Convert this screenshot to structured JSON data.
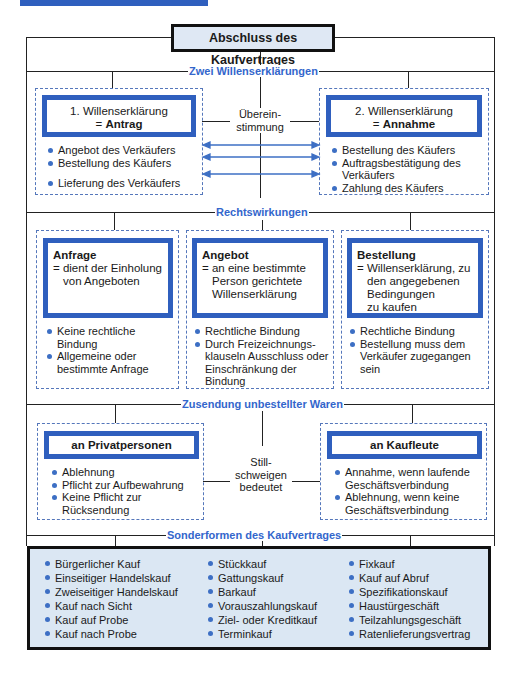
{
  "title": "Abschluss des Kaufvertrages",
  "sections": {
    "s1": "Zwei Willenserklärungen",
    "s2": "Rechtswirkungen",
    "s3": "Zusendung unbestellter Waren",
    "s4": "Sonderformen des Kaufvertrages"
  },
  "willen": {
    "left": {
      "line1": "1. Willenserklärung",
      "eq": "= ",
      "bold": "Antrag",
      "items": [
        "Angebot des Verkäufers",
        "Bestellung des Käufers",
        "Lieferung des Verkäufers"
      ]
    },
    "right": {
      "line1": "2. Willenserklärung",
      "eq": "= ",
      "bold": "Annahme",
      "items": [
        "Bestellung des Käufers",
        "Auftragsbestätigung des Verkäufers",
        "Zahlung des Käufers"
      ]
    },
    "middle": [
      "Überein-",
      "stimmung"
    ]
  },
  "rechts": [
    {
      "title": "Anfrage",
      "desc": [
        "= dient der Einholung",
        "von Angeboten"
      ],
      "items": [
        "Keine rechtliche Bindung",
        "Allgemeine oder bestimmte Anfrage"
      ]
    },
    {
      "title": "Angebot",
      "desc": [
        "= an eine bestimmte",
        "Person gerichtete",
        "Willenserklärung"
      ],
      "items": [
        "Rechtliche Bindung",
        "Durch Freizeichnungs-klauseln Ausschluss oder Einschränkung der Bindung"
      ]
    },
    {
      "title": "Bestellung",
      "desc": [
        "= Willenserklärung, zu",
        "den angegebenen",
        "Bedingungen",
        "zu kaufen"
      ],
      "items": [
        "Rechtliche Bindung",
        "Bestellung muss dem Verkäufer zugegangen sein"
      ]
    }
  ],
  "zusendung": {
    "left": {
      "title": "an Privatpersonen",
      "items": [
        "Ablehnung",
        "Pflicht zur Aufbewahrung",
        "Keine Pflicht zur Rücksendung"
      ]
    },
    "right": {
      "title": "an Kaufleute",
      "items": [
        "Annahme, wenn laufende Geschäftsverbindung",
        "Ablehnung, wenn keine Geschäftsverbindung"
      ]
    },
    "middle": [
      "Still-",
      "schweigen",
      "bedeutet"
    ]
  },
  "sonderformen": [
    [
      "Bürgerlicher Kauf",
      "Einseitiger Handelskauf",
      "Zweiseitiger Handelskauf",
      "Kauf nach Sicht",
      "Kauf auf Probe",
      "Kauf nach Probe"
    ],
    [
      "Stückkauf",
      "Gattungskauf",
      "Barkauf",
      "Vorauszahlungskauf",
      "Ziel- oder Kreditkauf",
      "Terminkauf"
    ],
    [
      "Fixkauf",
      "Kauf auf Abruf",
      "Spezifikationskauf",
      "Haustürgeschäft",
      "Teilzahlungsgeschäft",
      "Ratenlieferungsvertrag"
    ]
  ],
  "colors": {
    "accent": "#2f5fbe",
    "section_text": "#3366cc",
    "bottom_fill": "#dbe7f3"
  }
}
